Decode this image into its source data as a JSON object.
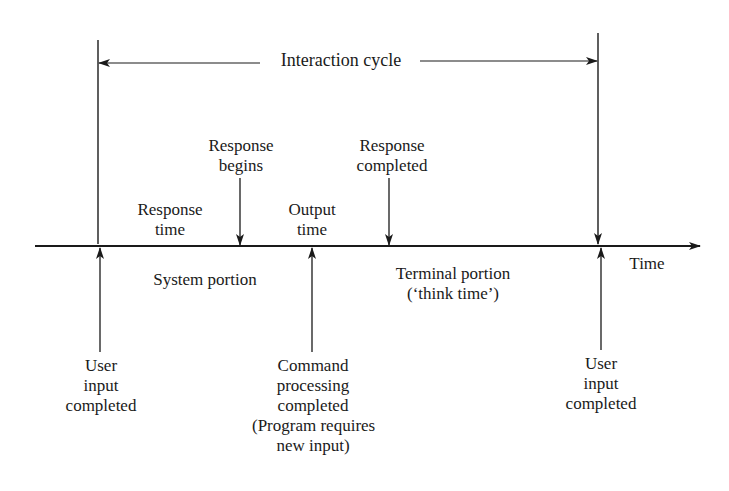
{
  "diagram": {
    "title": "Interaction cycle",
    "axis_label": "Time",
    "above_axis": {
      "response_time": [
        "Response",
        "time"
      ],
      "response_begins": [
        "Response",
        "begins"
      ],
      "output_time": [
        "Output",
        "time"
      ],
      "response_completed": [
        "Response",
        "completed"
      ]
    },
    "below_axis": {
      "system_portion": "System portion",
      "terminal_portion": [
        "Terminal portion",
        "(‘think time’)"
      ]
    },
    "events": {
      "user_input_completed_start": [
        "User",
        "input",
        "completed"
      ],
      "command_processing_completed": [
        "Command",
        "processing",
        "completed",
        "(Program requires",
        "new input)"
      ],
      "user_input_completed_end": [
        "User",
        "input",
        "completed"
      ]
    },
    "colors": {
      "ink": "#1a1a1a",
      "background": "#ffffff"
    }
  }
}
